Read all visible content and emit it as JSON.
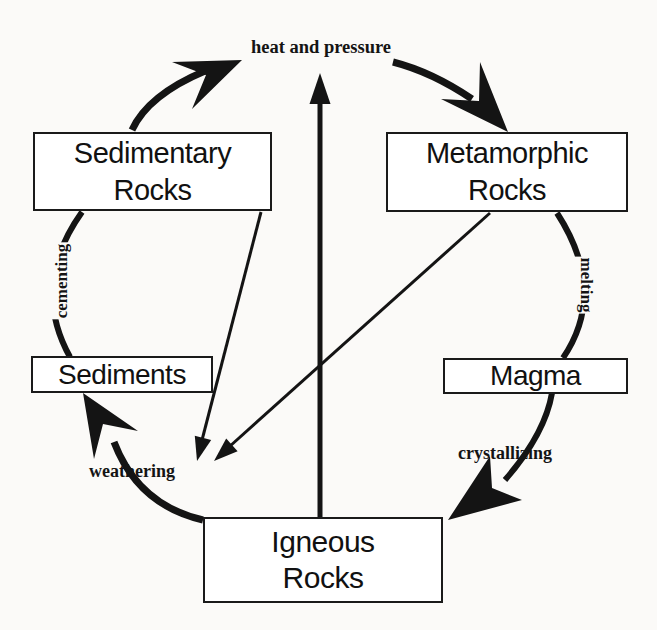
{
  "nodes": {
    "sedimentary": {
      "line1": "Sedimentary",
      "line2": "Rocks"
    },
    "metamorphic": {
      "line1": "Metamorphic",
      "line2": "Rocks"
    },
    "sediments": {
      "label": "Sediments"
    },
    "magma": {
      "label": "Magma"
    },
    "igneous": {
      "line1": "Igneous",
      "line2": "Rocks"
    }
  },
  "process_labels": {
    "heat_and_pressure": "heat and pressure",
    "cementing": "cementing",
    "melting": "melting",
    "weathering": "weathering",
    "crystallizing": "crystallizing"
  },
  "edges": [
    {
      "from": "Sedimentary Rocks",
      "via": "heat and pressure",
      "to": "Metamorphic Rocks",
      "style": "thick-curved-arrow"
    },
    {
      "from": "Metamorphic Rocks",
      "via": "melting",
      "to": "Magma",
      "style": "curved-line"
    },
    {
      "from": "Magma",
      "via": "crystallizing",
      "to": "Igneous Rocks",
      "style": "curved-arrow"
    },
    {
      "from": "Igneous Rocks",
      "via": "weathering",
      "to": "Sediments",
      "style": "curved-arrow"
    },
    {
      "from": "Sediments",
      "via": "cementing",
      "to": "Sedimentary Rocks",
      "style": "curved-line"
    },
    {
      "from": "Igneous Rocks",
      "to": "heat and pressure",
      "style": "straight-vertical-arrow"
    },
    {
      "from": "Sedimentary Rocks",
      "to": "weathering zone",
      "style": "thin-straight-arrow"
    },
    {
      "from": "Metamorphic Rocks",
      "to": "weathering zone",
      "style": "thin-straight-arrow"
    }
  ],
  "colors": {
    "ink": "#141414",
    "paper": "#fbfaf8",
    "box_fill": "#ffffff"
  }
}
